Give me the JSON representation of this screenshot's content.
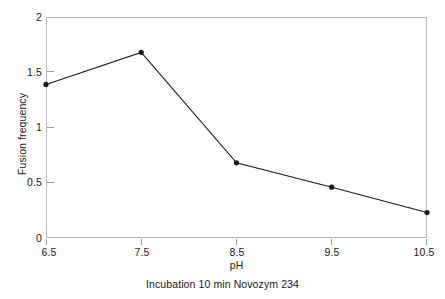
{
  "chart_data": {
    "type": "line",
    "title": "",
    "subtitle": "",
    "caption": "Incubation 10 min Novozym 234",
    "xlabel": "pH",
    "ylabel": "Fusion frequency",
    "x": [
      6.5,
      7.5,
      8.5,
      9.5,
      10.5
    ],
    "values": [
      1.39,
      1.68,
      0.68,
      0.46,
      0.23
    ],
    "series": [
      {
        "name": "Fusion frequency",
        "values": [
          1.39,
          1.68,
          0.68,
          0.46,
          0.23
        ]
      }
    ],
    "xlim": [
      6.5,
      10.5
    ],
    "ylim": [
      0,
      2
    ],
    "xticks": [
      6.5,
      7.5,
      8.5,
      9.5,
      10.5
    ],
    "yticks": [
      0,
      0.5,
      1,
      1.5,
      2
    ],
    "xtick_labels": [
      "6.5",
      "7.5",
      "8.5",
      "9.5",
      "10.5"
    ],
    "ytick_labels": [
      "0",
      "0.5",
      "1",
      "1.5",
      "2"
    ],
    "grid": false,
    "legend": false,
    "legend_position": "none",
    "marker": "filled-circle",
    "line_color": "#1a1a1a",
    "marker_color": "#1a1a1a",
    "frame_color": "#b9b9b9",
    "background_color": "#ffffff"
  },
  "axes": {
    "y_title": "Fusion frequency",
    "x_title": "pH"
  },
  "caption": {
    "text": "Incubation 10 min Novozym 234"
  }
}
